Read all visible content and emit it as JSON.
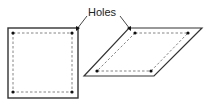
{
  "diagram": {
    "label": "Holes",
    "shapes": [
      {
        "name": "square",
        "holes": 4
      },
      {
        "name": "parallelogram",
        "holes": 4
      }
    ],
    "colors": {
      "stroke": "#333333",
      "dash": "#555555",
      "dot": "#111111"
    }
  }
}
